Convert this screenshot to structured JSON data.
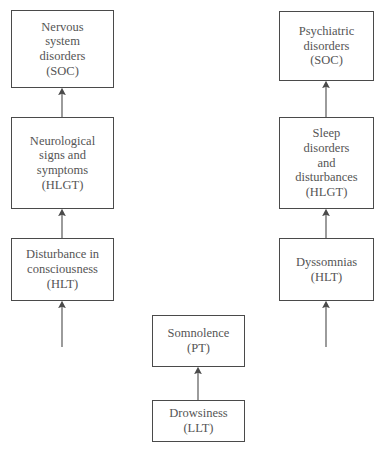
{
  "diagram": {
    "type": "hierarchy-flow",
    "title": "",
    "orientation": "bottom-up",
    "columns": [
      "left",
      "center",
      "right"
    ],
    "colors": {
      "box_border": "#4a4a4a",
      "box_fill": "#ffffff",
      "text": "#555555",
      "arrow": "#555555",
      "background": "#ffffff"
    },
    "nodes": {
      "soc_left": {
        "label": "Nervous\nsystem\ndisorders\n(SOC)",
        "level": "SOC",
        "column": "left"
      },
      "hlgt_left": {
        "label": "Neurological\nsigns and\nsymptoms\n(HLGT)",
        "level": "HLGT",
        "column": "left"
      },
      "hlt_left": {
        "label": "Disturbance in\nconsciousness\n(HLT)",
        "level": "HLT",
        "column": "left"
      },
      "soc_right": {
        "label": "Psychiatric\ndisorders\n(SOC)",
        "level": "SOC",
        "column": "right"
      },
      "hlgt_right": {
        "label": "Sleep\ndisorders\nand\ndisturbances\n(HLGT)",
        "level": "HLGT",
        "column": "right"
      },
      "hlt_right": {
        "label": "Dyssomnias\n(HLT)",
        "level": "HLT",
        "column": "right"
      },
      "pt_center": {
        "label": "Somnolence\n(PT)",
        "level": "PT",
        "column": "center"
      },
      "llt_center": {
        "label": "Drowsiness\n(LLT)",
        "level": "LLT",
        "column": "center"
      }
    },
    "edges": [
      {
        "from": "hlgt_left",
        "to": "soc_left",
        "style": "solid-arrow"
      },
      {
        "from": "hlt_left",
        "to": "hlgt_left",
        "style": "solid-arrow"
      },
      {
        "from": "open_left",
        "to": "hlt_left",
        "style": "solid-arrow-open-tail"
      },
      {
        "from": "hlgt_right",
        "to": "soc_right",
        "style": "solid-arrow"
      },
      {
        "from": "hlt_right",
        "to": "hlgt_right",
        "style": "solid-arrow"
      },
      {
        "from": "open_right",
        "to": "hlt_right",
        "style": "solid-arrow-open-tail"
      },
      {
        "from": "llt_center",
        "to": "pt_center",
        "style": "solid-arrow"
      }
    ]
  }
}
